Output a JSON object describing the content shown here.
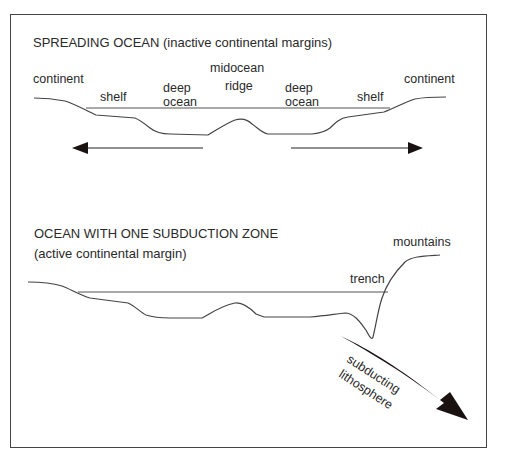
{
  "top_panel": {
    "title": "SPREADING OCEAN (inactive continental margins)",
    "labels": {
      "continent_left": "continent",
      "shelf_left": "shelf",
      "deep_ocean_left_1": "deep",
      "deep_ocean_left_2": "ocean",
      "ridge_1": "midocean",
      "ridge_2": "ridge",
      "deep_ocean_right_1": "deep",
      "deep_ocean_right_2": "ocean",
      "shelf_right": "shelf",
      "continent_right": "continent"
    },
    "arrows": [
      "left spreading arrow",
      "right spreading arrow"
    ]
  },
  "bottom_panel": {
    "title_line1": "OCEAN WITH ONE SUBDUCTION ZONE",
    "title_line2": "(active continental margin)",
    "labels": {
      "mountains": "mountains",
      "trench": "trench",
      "subducting_1": "subducting",
      "subducting_2": "lithosphere"
    }
  },
  "colors": {
    "line": "#444444",
    "arrow": "#1a1111",
    "frame": "#444444"
  }
}
